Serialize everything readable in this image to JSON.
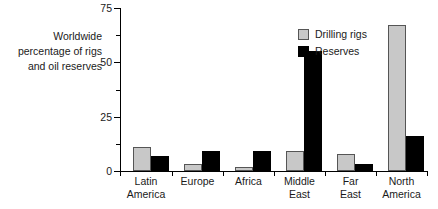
{
  "chart_data": {
    "type": "bar",
    "title": "",
    "xlabel": "",
    "ylabel": "Worldwide percentage of rigs and oil reserves",
    "ylabel_lines": [
      "Worldwide",
      "percentage of rigs",
      "and oil reserves"
    ],
    "categories": [
      "Latin America",
      "Europe",
      "Africa",
      "Middle East",
      "Far East",
      "North America"
    ],
    "category_lines": [
      [
        "Latin",
        "America"
      ],
      [
        "Europe"
      ],
      [
        "Africa"
      ],
      [
        "Middle",
        "East"
      ],
      [
        "Far",
        "East"
      ],
      [
        "North",
        "America"
      ]
    ],
    "series": [
      {
        "name": "Drilling rigs",
        "color": "#c8c8c8",
        "values": [
          11,
          3,
          2,
          9,
          8,
          67
        ]
      },
      {
        "name": "Reserves",
        "color": "#000000",
        "values": [
          7,
          9,
          9,
          55,
          3,
          16
        ]
      }
    ],
    "ylim": [
      0,
      75
    ],
    "yticks": [
      0,
      25,
      50,
      75
    ],
    "ytick_labels": [
      "0",
      "25",
      "50",
      "75"
    ],
    "yminor_ticks": [
      12.5,
      37.5,
      62.5
    ],
    "grid": false,
    "legend_position": "upper-center"
  }
}
